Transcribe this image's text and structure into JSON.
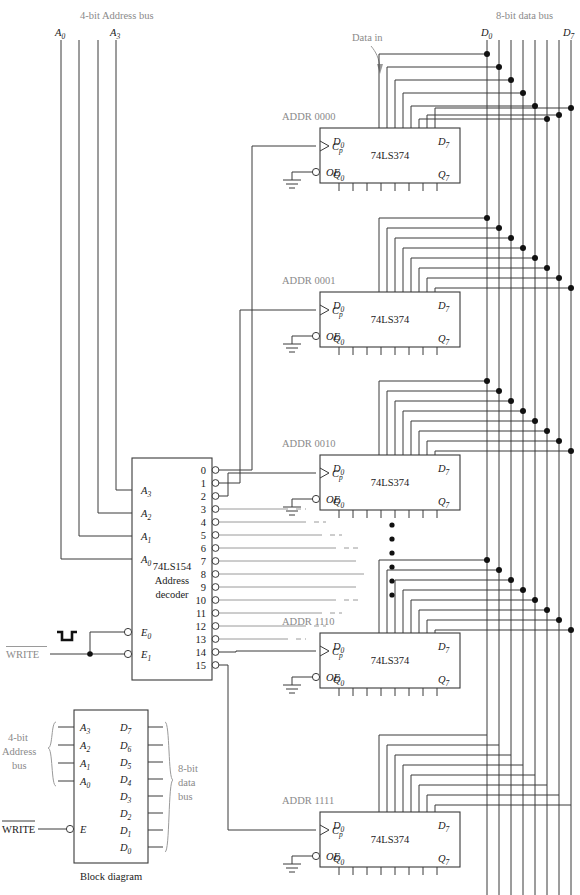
{
  "figure": {
    "caption": "Block diagram",
    "top_left_label": "4-bit Address bus",
    "top_right_label": "8-bit data bus",
    "data_in_label": "Data in"
  },
  "address_bus": {
    "label": "4-bit Address bus",
    "first_line_label": "A0",
    "last_line_label": "A3",
    "line_count": 4
  },
  "data_bus": {
    "label": "8-bit data bus",
    "first_line_label": "D0",
    "last_line_label": "D7",
    "line_count": 8
  },
  "decoder": {
    "part": "74LS154",
    "function_line1": "Address",
    "function_line2": "decoder",
    "inputs": [
      "A3",
      "A2",
      "A1",
      "A0"
    ],
    "enables": [
      "E0",
      "E1"
    ],
    "outputs": [
      "0",
      "1",
      "2",
      "3",
      "4",
      "5",
      "6",
      "7",
      "8",
      "9",
      "10",
      "11",
      "12",
      "13",
      "14",
      "15"
    ],
    "connected_outputs": [
      "0",
      "1",
      "2",
      "14",
      "15"
    ]
  },
  "write_signal": {
    "label": "WRITE",
    "overline": true,
    "waveform": "active-low-pulse"
  },
  "registers": [
    {
      "addr_label": "ADDR 0000",
      "part": "74LS374",
      "clock": "Cp",
      "oe": "OE",
      "d_first": "D0",
      "d_last": "D7",
      "q_first": "Q0",
      "q_last": "Q7"
    },
    {
      "addr_label": "ADDR 0001",
      "part": "74LS374",
      "clock": "Cp",
      "oe": "OE",
      "d_first": "D0",
      "d_last": "D7",
      "q_first": "Q0",
      "q_last": "Q7"
    },
    {
      "addr_label": "ADDR 0010",
      "part": "74LS374",
      "clock": "Cp",
      "oe": "OE",
      "d_first": "D0",
      "d_last": "D7",
      "q_first": "Q0",
      "q_last": "Q7"
    },
    {
      "addr_label": "ADDR 1110",
      "part": "74LS374",
      "clock": "Cp",
      "oe": "OE",
      "d_first": "D0",
      "d_last": "D7",
      "q_first": "Q0",
      "q_last": "Q7"
    },
    {
      "addr_label": "ADDR 1111",
      "part": "74LS374",
      "clock": "Cp",
      "oe": "OE",
      "d_first": "D0",
      "d_last": "D7",
      "q_first": "Q0",
      "q_last": "Q7"
    }
  ],
  "ellipsis": {
    "dot_count": 6
  },
  "block_diagram": {
    "caption": "Block diagram",
    "address_inputs": [
      "A3",
      "A2",
      "A1",
      "A0"
    ],
    "enable_input": "E",
    "write_label": "WRITE",
    "data_outputs": [
      "D7",
      "D6",
      "D5",
      "D4",
      "D3",
      "D2",
      "D1",
      "D0"
    ],
    "left_brace_label_line1": "4-bit",
    "left_brace_label_line2": "Address",
    "left_brace_label_line3": "bus",
    "right_brace_label_line1": "8-bit",
    "right_brace_label_line2": "data",
    "right_brace_label_line3": "bus"
  },
  "colors": {
    "wire": "#3a3a3a",
    "faint_wire": "#9a9a9a",
    "gray_text": "#8a8a8a",
    "text": "#1a1a1a",
    "background": "#ffffff"
  }
}
